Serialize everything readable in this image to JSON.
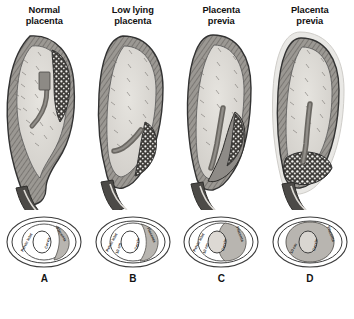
{
  "figure": {
    "background": "#ffffff",
    "panel_count": 4
  },
  "columns": [
    {
      "title": "Normal\nplacenta",
      "letter": "A",
      "uterus": {
        "description": "Sagittal section of gravid uterus with placenta implanted high on the posterior fundus, well away from the internal cervical os",
        "placenta_position": "fundal-posterior",
        "placenta_covers_os": false
      },
      "pelvis": {
        "labels": [
          "Pelvic inlet",
          "Cervix",
          "Placenta"
        ],
        "shows_10cm": false,
        "placenta_coverage": "none"
      }
    },
    {
      "title": "Low lying\nplacenta",
      "letter": "B",
      "uterus": {
        "description": "Sagittal section showing placenta implanted low in the lower uterine segment, near but not covering the internal os",
        "placenta_position": "low-lying-posterior",
        "placenta_covers_os": false
      },
      "pelvis": {
        "labels": [
          "Pelvic inlet",
          "10 cm",
          "Cervix",
          "Placenta"
        ],
        "shows_10cm": true,
        "placenta_coverage": "adjacent"
      }
    },
    {
      "title": "Placenta\nprevia",
      "letter": "C",
      "uterus": {
        "description": "Sagittal section showing placenta extending down over the lower segment and partially covering the internal cervical os",
        "placenta_position": "partial-previa",
        "placenta_covers_os": true
      },
      "pelvis": {
        "labels": [
          "Pelvic inlet",
          "10 cm",
          "Cervix",
          "Placenta"
        ],
        "shows_10cm": true,
        "placenta_coverage": "partial"
      }
    },
    {
      "title": "Placenta\nprevia",
      "letter": "D",
      "uterus": {
        "description": "Sagittal section showing placenta completely implanted across the lower uterine segment, totally covering the internal cervical os",
        "placenta_position": "complete-previa",
        "placenta_covers_os": true
      },
      "pelvis": {
        "labels": [
          "10 cm",
          "Cervix",
          "Placenta"
        ],
        "shows_10cm": true,
        "placenta_coverage": "complete"
      }
    }
  ],
  "colors": {
    "amniotic_cavity": "#dedcd7",
    "myometrium": "#8e8b86",
    "placenta_dark": "#3c3a38",
    "placenta_shade": "#b3b0ab",
    "cervix_canal": "#5d5b58",
    "outline": "#3a3a3a",
    "text": "#121212"
  }
}
